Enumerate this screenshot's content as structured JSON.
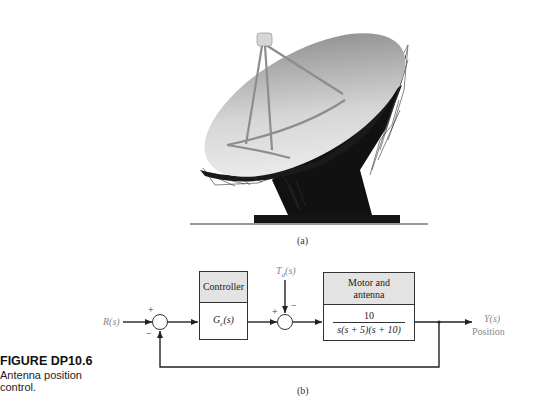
{
  "figure": {
    "title": "FIGURE DP10.6",
    "caption_lines": [
      "Antenna position",
      "control."
    ],
    "panel_a_label": "(a)",
    "panel_b_label": "(b)"
  },
  "illustration": {
    "subject": "radio-telescope-dish-antenna",
    "colors": {
      "dish_light": "#f2f2f2",
      "dish_dark": "#8a8a8a",
      "pedestal": "#111111",
      "ground": "#999999"
    }
  },
  "block_diagram": {
    "input_label": "R(s)",
    "summing_junction_1": {
      "plus": "+",
      "minus": "−"
    },
    "controller": {
      "header": "Controller",
      "transfer_function": "Gc(s)",
      "tf_main": "G",
      "tf_sub": "c",
      "tf_arg": "(s)"
    },
    "disturbance_label_main": "T",
    "disturbance_label_sub": "d",
    "disturbance_label_arg": "(s)",
    "summing_junction_2": {
      "plus": "+",
      "minus": "−"
    },
    "plant": {
      "header_line1": "Motor and",
      "header_line2": "antenna",
      "numerator": "10",
      "denominator": "s(s + 5)(s + 10)"
    },
    "output_label": "Y(s)",
    "output_sublabel": "Position"
  }
}
